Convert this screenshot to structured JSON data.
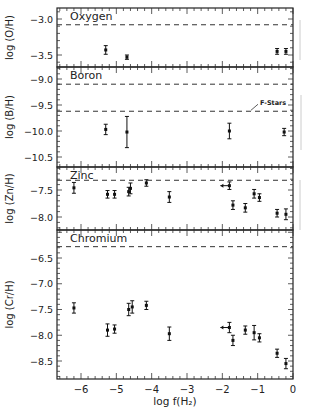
{
  "figure": {
    "xlabel": "log f(H₂)",
    "x_ticks": [
      -6,
      -5,
      -4,
      -3,
      -2,
      -1,
      0
    ],
    "x_tick_labels": [
      "−6",
      "−5",
      "−4",
      "−3",
      "−2",
      "−1",
      "0"
    ],
    "xlim": [
      -6.7,
      0
    ]
  },
  "chart_data": [
    {
      "type": "scatter",
      "title": "Oxygen",
      "ylabel": "log (O/H)",
      "ylim": [
        -3.65,
        -2.85
      ],
      "y_ticks": [
        -3.0,
        -3.5
      ],
      "y_tick_labels": [
        "−3.0",
        "−3.5"
      ],
      "reference_lines": [
        {
          "y": -3.08,
          "style": "dashed"
        }
      ],
      "points": [
        {
          "x": -5.3,
          "y": -3.43,
          "err": 0.06
        },
        {
          "x": -4.7,
          "y": -3.53,
          "err": 0.03
        },
        {
          "x": -0.45,
          "y": -3.45,
          "err": 0.04
        },
        {
          "x": -0.2,
          "y": -3.45,
          "err": 0.04
        }
      ]
    },
    {
      "type": "scatter",
      "title": "Boron",
      "ylabel": "log (B/H)",
      "ylim": [
        -10.7,
        -8.78
      ],
      "y_ticks": [
        -9.0,
        -9.5,
        -10.0,
        -10.5
      ],
      "y_tick_labels": [
        "−9.0",
        "−9.5",
        "−10.0",
        "−10.5"
      ],
      "reference_lines": [
        {
          "y": -9.1,
          "style": "dashed"
        },
        {
          "y": -9.62,
          "style": "dashed",
          "label": "F-Stars"
        }
      ],
      "annotations": [
        "F-Stars"
      ],
      "points": [
        {
          "x": -5.3,
          "y": -9.97,
          "err": 0.1
        },
        {
          "x": -4.7,
          "y": -10.02,
          "err": 0.3
        },
        {
          "x": -1.8,
          "y": -10.0,
          "err": 0.15
        },
        {
          "x": -0.25,
          "y": -10.02,
          "err": 0.07
        }
      ]
    },
    {
      "type": "scatter",
      "title": "Zinc",
      "ylabel": "log (Zn/H)",
      "ylim": [
        -8.25,
        -7.08
      ],
      "y_ticks": [
        -7.5,
        -8.0
      ],
      "y_tick_labels": [
        "−7.5",
        "−8.0"
      ],
      "reference_lines": [
        {
          "y": -7.32,
          "style": "dashed"
        }
      ],
      "points": [
        {
          "x": -6.2,
          "y": -7.46,
          "err": 0.1
        },
        {
          "x": -5.25,
          "y": -7.58,
          "err": 0.07
        },
        {
          "x": -5.05,
          "y": -7.58,
          "err": 0.07
        },
        {
          "x": -4.65,
          "y": -7.53,
          "err": 0.08
        },
        {
          "x": -4.6,
          "y": -7.47,
          "err": 0.1
        },
        {
          "x": -4.15,
          "y": -7.37,
          "err": 0.06
        },
        {
          "x": -3.5,
          "y": -7.63,
          "err": 0.1
        },
        {
          "x": -1.8,
          "y": -7.42,
          "err": 0.07,
          "upper_limit_arrow": "left"
        },
        {
          "x": -1.7,
          "y": -7.78,
          "err": 0.08
        },
        {
          "x": -1.35,
          "y": -7.83,
          "err": 0.08
        },
        {
          "x": -1.1,
          "y": -7.57,
          "err": 0.08
        },
        {
          "x": -0.95,
          "y": -7.64,
          "err": 0.07
        },
        {
          "x": -0.45,
          "y": -7.93,
          "err": 0.07
        },
        {
          "x": -0.2,
          "y": -7.95,
          "err": 0.1
        }
      ]
    },
    {
      "type": "scatter",
      "title": "Chromium",
      "ylabel": "log (Cr/H)",
      "ylim": [
        -8.85,
        -6.15
      ],
      "y_ticks": [
        -6.5,
        -7.0,
        -7.5,
        -8.0,
        -8.5
      ],
      "y_tick_labels": [
        "−6.5",
        "−7.0",
        "−7.5",
        "−8.0",
        "−8.5"
      ],
      "reference_lines": [
        {
          "y": -6.28,
          "style": "dashed"
        }
      ],
      "points": [
        {
          "x": -6.2,
          "y": -7.47,
          "err": 0.1
        },
        {
          "x": -5.25,
          "y": -7.9,
          "err": 0.12
        },
        {
          "x": -5.05,
          "y": -7.88,
          "err": 0.08
        },
        {
          "x": -4.65,
          "y": -7.5,
          "err": 0.12
        },
        {
          "x": -4.55,
          "y": -7.45,
          "err": 0.12
        },
        {
          "x": -4.15,
          "y": -7.42,
          "err": 0.08
        },
        {
          "x": -3.5,
          "y": -7.97,
          "err": 0.13
        },
        {
          "x": -1.8,
          "y": -7.85,
          "err": 0.1,
          "upper_limit_arrow": "left"
        },
        {
          "x": -1.7,
          "y": -8.1,
          "err": 0.1
        },
        {
          "x": -1.35,
          "y": -7.9,
          "err": 0.08
        },
        {
          "x": -1.1,
          "y": -7.95,
          "err": 0.14
        },
        {
          "x": -0.95,
          "y": -8.05,
          "err": 0.08
        },
        {
          "x": -0.45,
          "y": -8.35,
          "err": 0.08
        },
        {
          "x": -0.2,
          "y": -8.55,
          "err": 0.1
        }
      ]
    }
  ]
}
